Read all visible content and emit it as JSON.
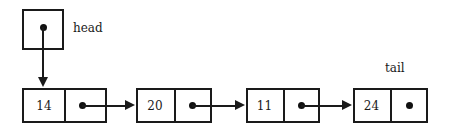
{
  "diagram": {
    "type": "singly-linked-list",
    "title": "",
    "background_color": "#ffffff",
    "line_color": "#1a1a1a"
  },
  "pointers": {
    "head": {
      "label": "head",
      "target_node_index": 0
    },
    "tail": {
      "label": "tail",
      "target_node_index": 3
    }
  },
  "nodes": [
    {
      "value": "14",
      "has_next_arrow": true
    },
    {
      "value": "20",
      "has_next_arrow": true
    },
    {
      "value": "11",
      "has_next_arrow": true
    },
    {
      "value": "24",
      "has_next_arrow": false
    }
  ]
}
